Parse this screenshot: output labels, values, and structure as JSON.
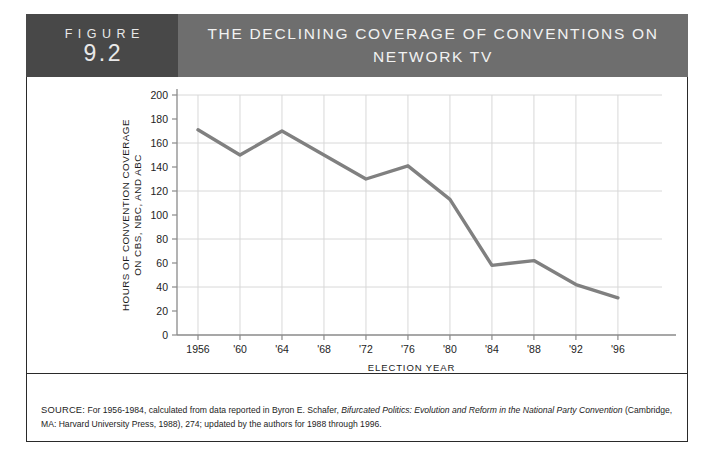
{
  "figure": {
    "tag_word": "FIGURE",
    "number": "9.2",
    "title": "THE DECLINING COVERAGE OF CONVENTIONS ON NETWORK TV",
    "title_line1": "THE DECLINING COVERAGE OF CONVENTIONS ON",
    "title_line2": "NETWORK TV"
  },
  "colors": {
    "tag_block": "#484848",
    "title_band": "#6e6e6e",
    "line": "#808080",
    "grid": "#d8d8d8",
    "axis": "#8a8a8a",
    "text": "#1d1d1d"
  },
  "source": {
    "label": "SOURCE:",
    "text_before_italic": " For 1956-1984, calculated from data reported in Byron E. Schafer, ",
    "italic_title": "Bifurcated Politics: Evolution and Reform in the National Party Convention",
    "text_after_italic": " (Cambridge, MA: Harvard University Press, 1988), 274; updated by the authors for 1988 through 1996."
  },
  "chart_data": {
    "type": "line",
    "title": "THE DECLINING COVERAGE OF CONVENTIONS ON NETWORK TV",
    "xlabel": "ELECTION YEAR",
    "ylabel": "HOURS OF CONVENTION COVERAGE ON CBS, NBC, AND ABC",
    "ylabel_line1": "HOURS OF CONVENTION COVERAGE",
    "ylabel_line2": "ON CBS, NBC, AND ABC",
    "categories": [
      "1956",
      "'60",
      "'64",
      "'68",
      "'72",
      "'76",
      "'80",
      "'84",
      "'88",
      "'92",
      "'96"
    ],
    "x_full_years": [
      1956,
      1960,
      1964,
      1968,
      1972,
      1976,
      1980,
      1984,
      1988,
      1992,
      1996
    ],
    "values": [
      171,
      150,
      170,
      150,
      130,
      141,
      113,
      58,
      62,
      42,
      31
    ],
    "ylim": [
      0,
      200
    ],
    "ytick_values": [
      0,
      20,
      40,
      60,
      80,
      100,
      120,
      140,
      160,
      180,
      200
    ],
    "ytick_labels": [
      "0",
      "20",
      "40",
      "60",
      "80",
      "100",
      "120",
      "140",
      "160",
      "180",
      "200"
    ],
    "gridline_values": [
      0,
      40,
      80,
      120,
      160,
      200
    ],
    "grid": "horizontal-and-vertical",
    "legend": "none",
    "series": [
      {
        "name": "Hours of convention coverage",
        "values": [
          171,
          150,
          170,
          150,
          130,
          141,
          113,
          58,
          62,
          42,
          31
        ]
      }
    ]
  }
}
